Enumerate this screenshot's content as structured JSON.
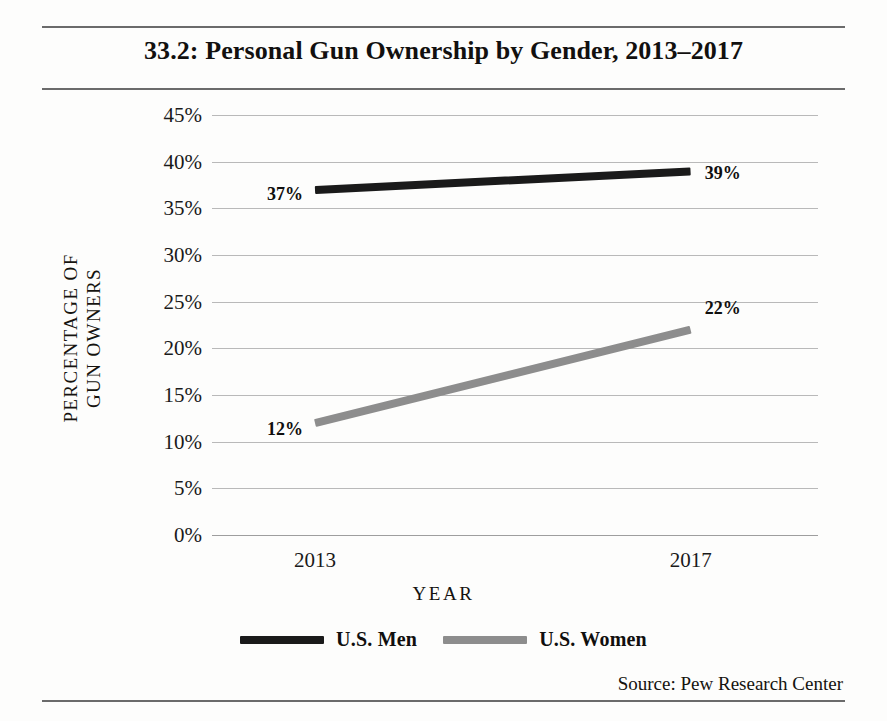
{
  "figure": {
    "title": "33.2: Personal Gun Ownership by Gender, 2013–2017",
    "source": "Source: Pew Research Center"
  },
  "axes": {
    "y_title_line1": "PERCENTAGE OF",
    "y_title_line2": "GUN OWNERS",
    "x_title": "YEAR"
  },
  "legend": {
    "items": [
      {
        "label": "U.S. Men",
        "color": "#1a1a1a"
      },
      {
        "label": "U.S. Women",
        "color": "#8d8d8d"
      }
    ]
  },
  "chart_data": {
    "type": "line",
    "title": "33.2: Personal Gun Ownership by Gender, 2013–2017",
    "xlabel": "YEAR",
    "ylabel": "PERCENTAGE OF GUN OWNERS",
    "categories": [
      "2013",
      "2017"
    ],
    "x": [
      2013,
      2017
    ],
    "ylim": [
      0,
      45
    ],
    "ytick_labels": [
      "45%",
      "40%",
      "35%",
      "30%",
      "25%",
      "20%",
      "15%",
      "10%",
      "5%",
      "0%"
    ],
    "ytick_values": [
      45,
      40,
      35,
      30,
      25,
      20,
      15,
      10,
      5,
      0
    ],
    "grid": true,
    "legend_position": "bottom",
    "series": [
      {
        "name": "U.S. Men",
        "color": "#1a1a1a",
        "values": [
          37,
          39
        ],
        "point_labels": [
          "37%",
          "39%"
        ]
      },
      {
        "name": "U.S. Women",
        "color": "#8d8d8d",
        "values": [
          12,
          22
        ],
        "point_labels": [
          "12%",
          "22%"
        ]
      }
    ],
    "annotations": [
      "Source: Pew Research Center"
    ]
  }
}
